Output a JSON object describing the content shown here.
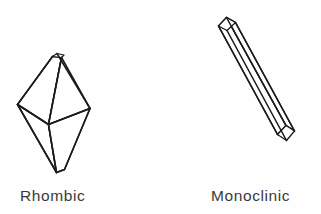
{
  "figure": {
    "background_color": "#fefefe",
    "line_color": "#1b1b1b",
    "label_color": "#3a3a3a",
    "width": 321,
    "height": 214
  },
  "crystals": [
    {
      "id": "rhombic",
      "label": "Rhombic",
      "shape_name": "rhombic-bipyramid",
      "description": "Elongated double pyramid (bipyramid) with a small truncated top facet",
      "label_position": {
        "x": 20,
        "y": 188
      }
    },
    {
      "id": "monoclinic",
      "label": "Monoclinic",
      "shape_name": "monoclinic-prism",
      "description": "Long slender needle-like prism inclined from upper-left to lower-right with oblique end faces",
      "label_position": {
        "x": 211,
        "y": 188
      }
    }
  ]
}
